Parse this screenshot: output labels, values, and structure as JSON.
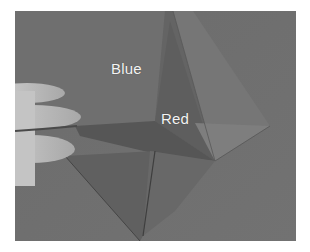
{
  "image": {
    "description": "Grayscale photograph of an origami fold being held by fingers",
    "labels": {
      "blue": "Blue",
      "red": "Red"
    },
    "colors": {
      "background_paper": "#6e6e6e",
      "upper_flap": "#737373",
      "red_flap": "#626262",
      "lower_shadow": "#5a5a5a",
      "bottom_flap": "#636363",
      "right_flap": "#7a7a7a",
      "hand": "#bdbdbd",
      "label_text": "#f4f4f4"
    }
  }
}
